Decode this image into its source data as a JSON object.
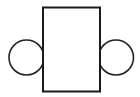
{
  "canvas": {
    "width": 140,
    "height": 97,
    "background_color": "#ffffff",
    "title": "Rectangle flanked by two circles"
  },
  "style": {
    "stroke_color": "#1a1a1a",
    "circle_stroke_color": "#222222",
    "fill_color": "#ffffff",
    "rect_stroke_width": 2,
    "circle_stroke_width": 1.6
  },
  "diagram": {
    "type": "line-drawing",
    "shape_count": 3,
    "shapes": [
      {
        "name": "left-circle",
        "kind": "circle",
        "cx": 26.5,
        "cy": 57.5,
        "r": 17.5,
        "label": "",
        "z_order": 1,
        "note": "drawn behind rectangle; right arc hidden"
      },
      {
        "name": "right-circle",
        "kind": "circle",
        "cx": 116,
        "cy": 57.5,
        "r": 17.5,
        "label": "",
        "z_order": 1,
        "note": "drawn behind rectangle; left arc hidden"
      },
      {
        "name": "center-rectangle",
        "kind": "rect",
        "x": 43,
        "y": 7.5,
        "width": 57,
        "height": 84,
        "label": "",
        "z_order": 2,
        "note": "white filled, occludes inner circle arcs"
      }
    ]
  }
}
